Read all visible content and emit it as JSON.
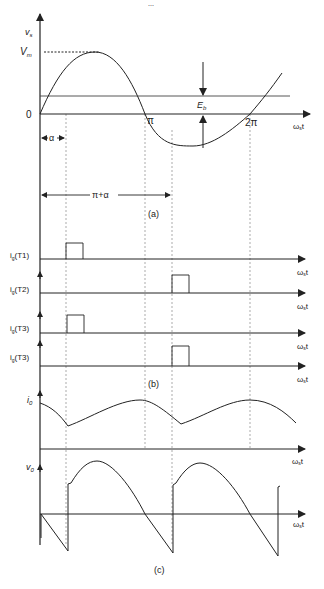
{
  "page_header": "...",
  "panel_a": {
    "caption": "(a)",
    "y_axis_label": "v",
    "y_axis_sub": "s",
    "vm_label": "V",
    "vm_sub": "m",
    "origin_label": "0",
    "pi_label": "π",
    "two_pi_label": "2π",
    "eb_label": "E",
    "eb_sub": "b",
    "x_axis_label": "ω",
    "x_axis_sub": "s",
    "x_axis_suffix": "t",
    "alpha_label": "α",
    "pi_alpha_label": "π+α"
  },
  "panel_b": {
    "caption": "(b)",
    "rows": [
      {
        "label": "i",
        "sub": "g",
        "suffix": "(T1)",
        "axis_label": "ω",
        "axis_sub": "s",
        "axis_suffix": "t"
      },
      {
        "label": "i",
        "sub": "g",
        "suffix": "(T2)",
        "axis_label": "ω",
        "axis_sub": "s",
        "axis_suffix": "t"
      },
      {
        "label": "i",
        "sub": "g",
        "suffix": "(T3)",
        "axis_label": "ω",
        "axis_sub": "s",
        "axis_suffix": "t"
      },
      {
        "label": "i",
        "sub": "g",
        "suffix": "(T3)",
        "axis_label": "ω",
        "axis_sub": "s",
        "axis_suffix": "t"
      }
    ]
  },
  "panel_c": {
    "caption": "(c)",
    "io_label": "i",
    "io_sub": "0",
    "vo_label": "v",
    "vo_sub": "0",
    "io_axis_label": "ω",
    "io_axis_sub": "s",
    "io_axis_suffix": "t",
    "vo_axis_label": "ω",
    "vo_axis_sub": "s",
    "vo_axis_suffix": "t"
  },
  "colors": {
    "line": "#333333",
    "dashed": "#888888"
  }
}
